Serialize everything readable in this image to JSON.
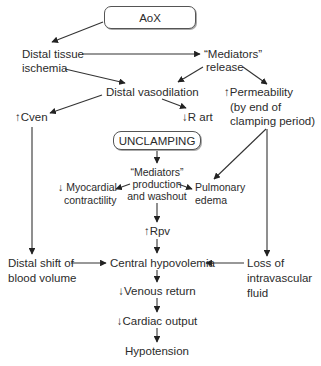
{
  "diagram": {
    "type": "flowchart",
    "nodes": {
      "aox": "AoX",
      "distal_ischemia": [
        "Distal tissue",
        "ischemia"
      ],
      "mediators_release": [
        "“Mediators”",
        "release"
      ],
      "distal_vasodilation": "Distal vasodilation",
      "permeability": [
        "↑Permeability",
        "(by end of",
        "clamping period)"
      ],
      "cven": "↑Cven",
      "r_art": "↓R art",
      "unclamping": "UNCLAMPING",
      "mediators_production": [
        "“Mediators”",
        "production",
        "and washout"
      ],
      "myocardial": [
        "↓ Myocardial",
        "contractility"
      ],
      "pulmonary": [
        "Pulmonary",
        "edema"
      ],
      "rpv": "↑Rpv",
      "distal_shift": [
        "Distal shift of",
        "blood volume"
      ],
      "central_hypovolemia": "Central hypovolemia",
      "loss_fluid": [
        "Loss of",
        "intravascular",
        "fluid"
      ],
      "venous_return": "↓Venous return",
      "cardiac_output": "↓Cardiac output",
      "hypotension": "Hypotension"
    },
    "edges": [
      [
        "aox",
        "distal_ischemia"
      ],
      [
        "distal_ischemia",
        "mediators_release"
      ],
      [
        "distal_ischemia",
        "distal_vasodilation"
      ],
      [
        "mediators_release",
        "distal_vasodilation"
      ],
      [
        "mediators_release",
        "permeability"
      ],
      [
        "distal_vasodilation",
        "cven"
      ],
      [
        "distal_vasodilation",
        "r_art"
      ],
      [
        "unclamping",
        "mediators_production"
      ],
      [
        "mediators_production",
        "myocardial"
      ],
      [
        "mediators_production",
        "pulmonary"
      ],
      [
        "permeability",
        "pulmonary"
      ],
      [
        "mediators_production",
        "rpv"
      ],
      [
        "cven",
        "distal_shift"
      ],
      [
        "permeability",
        "loss_fluid"
      ],
      [
        "rpv",
        "central_hypovolemia"
      ],
      [
        "distal_shift",
        "central_hypovolemia"
      ],
      [
        "loss_fluid",
        "central_hypovolemia"
      ],
      [
        "central_hypovolemia",
        "venous_return"
      ],
      [
        "venous_return",
        "cardiac_output"
      ],
      [
        "cardiac_output",
        "hypotension"
      ]
    ]
  }
}
